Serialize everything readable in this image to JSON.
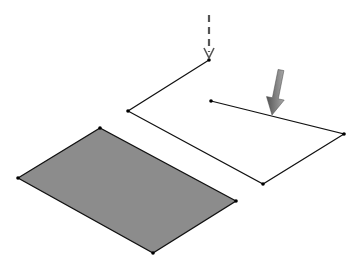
{
  "diagram": {
    "colors": {
      "background": "#ffffff",
      "face_fill": "#8c8c8c",
      "stroke": "#111111",
      "arrow_fill": "#6e6e6e",
      "dashed_arrow": "#555555"
    },
    "face": {
      "points": [
        [
          18,
          178
        ],
        [
          100,
          128
        ],
        [
          236,
          201
        ],
        [
          153,
          253
        ]
      ]
    },
    "polyline": {
      "points": [
        [
          209,
          60
        ],
        [
          128,
          111
        ],
        [
          263,
          184
        ],
        [
          344,
          134
        ],
        [
          211,
          101
        ]
      ]
    },
    "dashed_arrow": {
      "from": [
        209,
        15
      ],
      "to": [
        209,
        58
      ]
    },
    "solid_arrow": {
      "from": [
        281,
        70
      ],
      "to": [
        272,
        115
      ]
    },
    "caption_truncated": true
  }
}
